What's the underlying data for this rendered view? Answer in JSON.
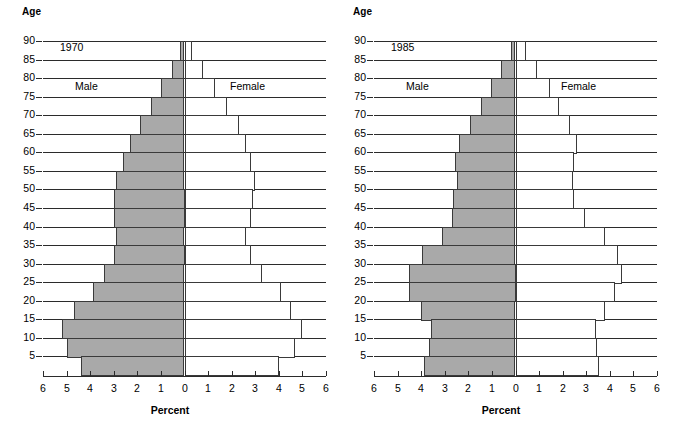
{
  "figure": {
    "width": 677,
    "height": 422,
    "background": "#ffffff",
    "male_fill": "#a9a9a9",
    "female_fill": "#ffffff",
    "line_color": "#2b2b2b"
  },
  "axis_titles": {
    "age": "Age",
    "percent": "Percent"
  },
  "sex_labels": {
    "male": "Male",
    "female": "Female"
  },
  "x_ticks": [
    6,
    5,
    4,
    3,
    2,
    1,
    0,
    1,
    2,
    3,
    4,
    5,
    6
  ],
  "x_tick_labels": [
    "6",
    "5",
    "4",
    "3",
    "2",
    "1",
    "0",
    "1",
    "2",
    "3",
    "4",
    "5",
    "6"
  ],
  "y_tick_labels": [
    "5",
    "10",
    "15",
    "20",
    "25",
    "30",
    "35",
    "40",
    "45",
    "50",
    "55",
    "60",
    "65",
    "70",
    "75",
    "80",
    "85",
    "90"
  ],
  "chart_data": [
    {
      "type": "bar",
      "subtype": "population-pyramid",
      "title": "1970",
      "xlabel": "Percent",
      "ylabel": "Age",
      "xlim": [
        -6,
        6
      ],
      "xticks": [
        6,
        5,
        4,
        3,
        2,
        1,
        0,
        1,
        2,
        3,
        4,
        5,
        6
      ],
      "grid": false,
      "legend": [
        "Male",
        "Female"
      ],
      "legend_position": "in-plot",
      "categories": [
        "5",
        "10",
        "15",
        "20",
        "25",
        "30",
        "35",
        "40",
        "45",
        "50",
        "55",
        "60",
        "65",
        "70",
        "75",
        "80",
        "85",
        "90"
      ],
      "series": [
        {
          "name": "Male",
          "side": "left",
          "values": [
            4.4,
            5.0,
            5.2,
            4.7,
            3.9,
            3.4,
            3.0,
            2.9,
            3.0,
            3.0,
            2.9,
            2.6,
            2.3,
            1.9,
            1.4,
            1.0,
            0.55,
            0.2
          ]
        },
        {
          "name": "Female",
          "side": "right",
          "values": [
            4.0,
            4.7,
            5.0,
            4.5,
            4.1,
            3.3,
            2.8,
            2.6,
            2.8,
            2.9,
            3.0,
            2.8,
            2.6,
            2.3,
            1.8,
            1.3,
            0.8,
            0.3
          ]
        }
      ]
    },
    {
      "type": "bar",
      "subtype": "population-pyramid",
      "title": "1985",
      "xlabel": "Percent",
      "ylabel": "Age",
      "xlim": [
        -6,
        6
      ],
      "xticks": [
        6,
        5,
        4,
        3,
        2,
        1,
        0,
        1,
        2,
        3,
        4,
        5,
        6
      ],
      "grid": false,
      "legend": [
        "Male",
        "Female"
      ],
      "legend_position": "in-plot",
      "categories": [
        "5",
        "10",
        "15",
        "20",
        "25",
        "30",
        "35",
        "40",
        "45",
        "50",
        "55",
        "60",
        "65",
        "70",
        "75",
        "80",
        "85",
        "90"
      ],
      "series": [
        {
          "name": "Male",
          "side": "left",
          "values": [
            3.9,
            3.65,
            3.6,
            4.0,
            4.5,
            4.5,
            3.95,
            3.1,
            2.7,
            2.65,
            2.5,
            2.55,
            2.4,
            1.95,
            1.45,
            1.05,
            0.6,
            0.2
          ]
        },
        {
          "name": "Female",
          "side": "right",
          "values": [
            3.55,
            3.45,
            3.4,
            3.8,
            4.2,
            4.5,
            4.35,
            3.8,
            2.95,
            2.5,
            2.45,
            2.5,
            2.6,
            2.3,
            1.85,
            1.45,
            0.9,
            0.45
          ]
        }
      ]
    }
  ]
}
